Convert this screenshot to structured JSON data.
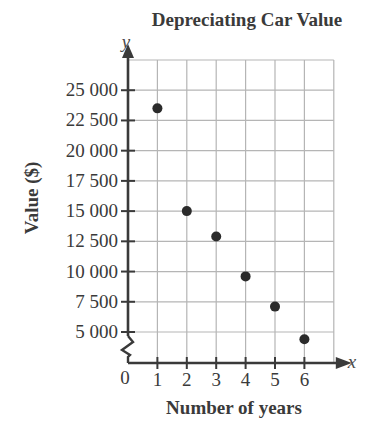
{
  "chart_data": {
    "type": "scatter",
    "title": "Depreciating Car Value",
    "xlabel": "Number of years",
    "ylabel": "Value ($)",
    "x_axis_var": "x",
    "y_axis_var": "y",
    "origin_label": "0",
    "x_ticks": [
      "1",
      "2",
      "3",
      "4",
      "5",
      "6"
    ],
    "y_ticks": [
      "5 000",
      "7 500",
      "10 000",
      "12 500",
      "15 000",
      "17 500",
      "20 000",
      "22 500",
      "25 000"
    ],
    "x": [
      1,
      2,
      3,
      4,
      5,
      6
    ],
    "values": [
      23500,
      15000,
      12900,
      9600,
      7100,
      4400
    ],
    "xlim": [
      0,
      7
    ],
    "ylim": [
      5000,
      27500
    ],
    "y_axis_break": true,
    "grid": true,
    "legend": null,
    "colors": {
      "points": "#2b2b2b",
      "axes": "#3a3a3a",
      "grid": "#b5b5b5",
      "text": "#3a3a3a"
    }
  }
}
